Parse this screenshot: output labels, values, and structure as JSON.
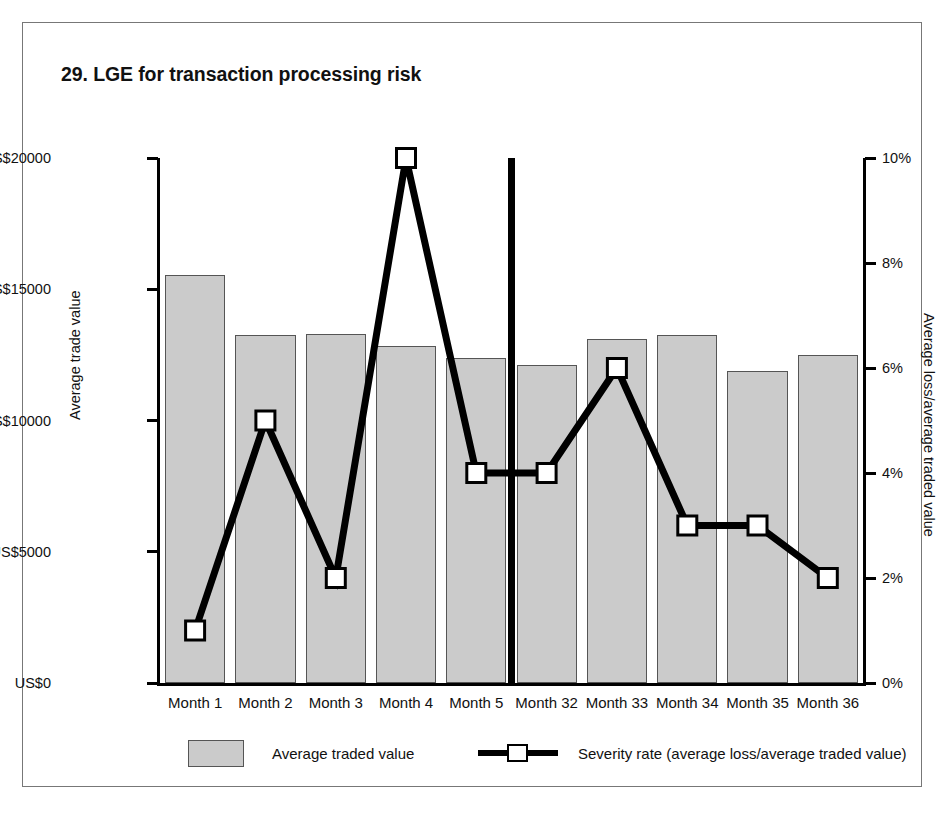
{
  "figure": {
    "title": "29. LGE for transaction processing risk"
  },
  "chart_data": {
    "type": "bar",
    "title": "29. LGE for transaction processing risk",
    "xlabel": "",
    "ylabel": "Average trade value",
    "y2label": "Average loss/average traded value",
    "categories": [
      "Month 1",
      "Month 2",
      "Month 3",
      "Month 4",
      "Month 5",
      "Month 32",
      "Month 33",
      "Month 34",
      "Month 35",
      "Month 36"
    ],
    "series": [
      {
        "name": "Average traded value",
        "type": "bar",
        "axis": "left",
        "unit": "US$",
        "color": "#cbcbcb",
        "values": [
          15550,
          13250,
          13300,
          12850,
          12400,
          12100,
          13100,
          13250,
          11900,
          12500
        ]
      },
      {
        "name": "Severity rate (average loss/average traded value)",
        "type": "line",
        "axis": "right",
        "unit": "%",
        "color": "#000000",
        "marker": "white-square",
        "values": [
          1,
          5,
          2,
          10,
          4,
          4,
          6,
          3,
          3,
          2
        ]
      }
    ],
    "ylim": [
      0,
      20000
    ],
    "yticks": [
      0,
      5000,
      10000,
      15000,
      20000
    ],
    "ytick_labels": [
      "US$0",
      "US$5000",
      "US$10000",
      "US$15000",
      "US$20000"
    ],
    "y2lim": [
      0,
      10
    ],
    "y2ticks": [
      0,
      2,
      4,
      6,
      8,
      10
    ],
    "y2tick_labels": [
      "0%",
      "2%",
      "4%",
      "6%",
      "8%",
      "10%"
    ],
    "grid": false,
    "legend_position": "bottom",
    "annotations": [
      {
        "name": "period-break-separator",
        "description": "Thick vertical rule between Month 5 and Month 32 indicating a time gap"
      }
    ]
  },
  "legend": {
    "items": [
      {
        "label": "Average traded value",
        "marker": "filled-rect"
      },
      {
        "label": "Severity rate (average loss/average traded value)",
        "marker": "line-with-square"
      }
    ]
  }
}
